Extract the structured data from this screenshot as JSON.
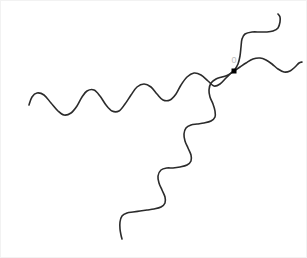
{
  "figure": {
    "type": "diagram",
    "width": 307,
    "height": 258,
    "background_color": "#ffffff",
    "stroke_color": "#2b2b2b",
    "stroke_width": 1.6,
    "marker_color": "#000000",
    "label_color": "#bdbdbd"
  },
  "node": {
    "label": "0",
    "x": 233,
    "y": 70,
    "marker_size": 5,
    "label_x": 233,
    "label_y": 60
  },
  "chart_data": {
    "type": "line",
    "xlabel": "",
    "ylabel": "",
    "xlim": [
      0,
      307
    ],
    "ylim": [
      0,
      258
    ],
    "grid": false,
    "legend": "none",
    "annotations": [
      {
        "text": "0",
        "x": 233,
        "y": 60,
        "color": "#bdbdbd",
        "marker": "square",
        "marker_x": 233,
        "marker_y": 70,
        "marker_color": "#000000"
      }
    ],
    "series": [
      {
        "name": "wavy-branch-left",
        "color": "#2b2b2b",
        "points": [
          [
            28,
            104
          ],
          [
            31,
            96
          ],
          [
            36,
            92
          ],
          [
            43,
            94
          ],
          [
            50,
            102
          ],
          [
            57,
            110
          ],
          [
            63,
            114
          ],
          [
            70,
            112
          ],
          [
            76,
            105
          ],
          [
            81,
            96
          ],
          [
            86,
            90
          ],
          [
            93,
            89
          ],
          [
            99,
            95
          ],
          [
            105,
            104
          ],
          [
            111,
            110
          ],
          [
            118,
            110
          ],
          [
            124,
            103
          ],
          [
            130,
            94
          ],
          [
            136,
            86
          ],
          [
            143,
            83
          ],
          [
            150,
            86
          ],
          [
            156,
            93
          ],
          [
            162,
            99
          ],
          [
            169,
            99
          ],
          [
            175,
            93
          ],
          [
            180,
            84
          ],
          [
            186,
            76
          ],
          [
            193,
            72
          ],
          [
            200,
            74
          ],
          [
            207,
            80
          ],
          [
            213,
            85
          ],
          [
            219,
            83
          ],
          [
            225,
            77
          ],
          [
            230,
            72
          ],
          [
            233,
            70
          ]
        ]
      },
      {
        "name": "wavy-branch-upper-right",
        "color": "#2b2b2b",
        "points": [
          [
            233,
            70
          ],
          [
            239,
            66
          ],
          [
            245,
            62
          ],
          [
            252,
            58
          ],
          [
            259,
            57
          ],
          [
            265,
            59
          ],
          [
            271,
            63
          ],
          [
            277,
            68
          ],
          [
            283,
            71
          ],
          [
            289,
            70
          ],
          [
            294,
            66
          ],
          [
            298,
            62
          ],
          [
            301,
            61
          ]
        ]
      },
      {
        "name": "staircase-branch-upper",
        "color": "#2b2b2b",
        "points": [
          [
            233,
            70
          ],
          [
            237,
            63
          ],
          [
            239,
            55
          ],
          [
            240,
            46
          ],
          [
            241,
            38
          ],
          [
            244,
            33
          ],
          [
            251,
            31
          ],
          [
            259,
            31
          ],
          [
            266,
            31
          ],
          [
            272,
            30
          ],
          [
            277,
            27
          ],
          [
            279,
            21
          ],
          [
            279,
            16
          ],
          [
            277,
            13
          ]
        ]
      },
      {
        "name": "staircase-branch-lower",
        "color": "#2b2b2b",
        "points": [
          [
            233,
            70
          ],
          [
            227,
            74
          ],
          [
            221,
            76
          ],
          [
            215,
            78
          ],
          [
            210,
            82
          ],
          [
            208,
            89
          ],
          [
            209,
            96
          ],
          [
            212,
            103
          ],
          [
            214,
            110
          ],
          [
            214,
            116
          ],
          [
            210,
            120
          ],
          [
            203,
            122
          ],
          [
            196,
            123
          ],
          [
            190,
            124
          ],
          [
            185,
            127
          ],
          [
            183,
            133
          ],
          [
            184,
            140
          ],
          [
            187,
            147
          ],
          [
            190,
            154
          ],
          [
            190,
            160
          ],
          [
            186,
            164
          ],
          [
            179,
            166
          ],
          [
            172,
            167
          ],
          [
            166,
            167
          ],
          [
            160,
            169
          ],
          [
            157,
            175
          ],
          [
            158,
            182
          ],
          [
            161,
            189
          ],
          [
            164,
            196
          ],
          [
            164,
            202
          ],
          [
            160,
            206
          ],
          [
            153,
            208
          ],
          [
            146,
            209
          ],
          [
            139,
            210
          ],
          [
            132,
            211
          ],
          [
            126,
            212
          ],
          [
            121,
            215
          ],
          [
            119,
            221
          ],
          [
            119,
            228
          ],
          [
            120,
            234
          ],
          [
            121,
            238
          ]
        ]
      }
    ]
  }
}
